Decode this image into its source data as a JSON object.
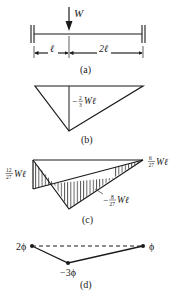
{
  "figure": {
    "panel_a": {
      "caption": "(a)",
      "load_label": "W",
      "span_left_label": "ℓ",
      "span_right_label": "2ℓ"
    },
    "panel_b": {
      "caption": "(b)",
      "moment_label_sign": "−",
      "moment_label_num": "2",
      "moment_label_den": "3",
      "moment_label_suffix": "Wℓ"
    },
    "panel_c": {
      "caption": "(c)",
      "left_label_num": "12",
      "left_label_den": "27",
      "left_label_suffix": "Wℓ",
      "right_label_num": "6",
      "right_label_den": "27",
      "right_label_suffix": "Wℓ",
      "mid_label_sign": "−",
      "mid_label_num": "8",
      "mid_label_den": "27",
      "mid_label_suffix": "Wℓ"
    },
    "panel_d": {
      "caption": "(d)",
      "left_label": "2ϕ",
      "mid_label": "−3ϕ",
      "right_label": "ϕ"
    },
    "colors": {
      "ink": "#1a1a1a",
      "background": "#ffffff"
    }
  }
}
